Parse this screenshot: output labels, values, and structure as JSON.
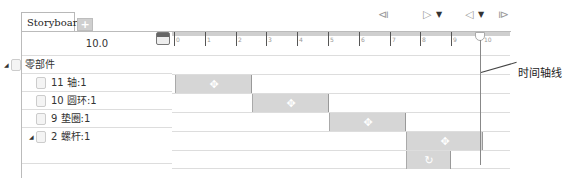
{
  "tabs": {
    "active": "Storyboard1",
    "add_label": "+"
  },
  "controls": {
    "rewind_icon": "skip-to-start",
    "play_icon": "play-forward",
    "play_dropdown": "▼",
    "reverse_icon": "play-reverse",
    "reverse_dropdown": "▼",
    "end_icon": "skip-to-end"
  },
  "time": {
    "current": "10.0"
  },
  "ruler": {
    "labels": [
      "0",
      "1",
      "2",
      "3",
      "4",
      "5",
      "6",
      "7",
      "8",
      "9",
      "10"
    ]
  },
  "tree": {
    "root": {
      "label": "零部件"
    },
    "items": [
      {
        "label": "11 轴:1"
      },
      {
        "label": "10 圆环:1"
      },
      {
        "label": "9 垫圈:1"
      },
      {
        "label": "2 螺杆:1"
      }
    ]
  },
  "annotation": {
    "timeline_cursor": "时间轴线"
  }
}
